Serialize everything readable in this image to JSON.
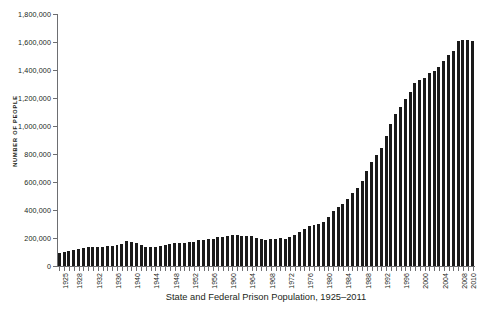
{
  "chart_data": {
    "type": "bar",
    "title": "State and Federal Prison Population, 1925–2011",
    "xlabel": "",
    "ylabel": "NUMBER OF PEOPLE",
    "ylim": [
      0,
      1800000
    ],
    "ytick_labels": [
      "0",
      "200,000",
      "400,000",
      "600,000",
      "800,000",
      "1,000,000",
      "1,200,000",
      "1,400,000",
      "1,600,000",
      "1,800,000"
    ],
    "ytick_values": [
      0,
      200000,
      400000,
      600000,
      800000,
      1000000,
      1200000,
      1400000,
      1600000,
      1800000
    ],
    "grid": false,
    "legend": null,
    "bar_color": "#1a1a1a",
    "axis_color": "#6d6e71",
    "xtick_labels": [
      "1925",
      "1928",
      "1932",
      "1936",
      "1940",
      "1944",
      "1948",
      "1952",
      "1956",
      "1960",
      "1964",
      "1968",
      "1972",
      "1976",
      "1980",
      "1984",
      "1988",
      "1992",
      "1996",
      "2000",
      "2004",
      "2008",
      "2010"
    ],
    "xtick_years": [
      1925,
      1928,
      1932,
      1936,
      1940,
      1944,
      1948,
      1952,
      1956,
      1960,
      1964,
      1968,
      1972,
      1976,
      1980,
      1984,
      1988,
      1992,
      1996,
      2000,
      2004,
      2008,
      2010
    ],
    "categories": [
      1925,
      1926,
      1927,
      1928,
      1929,
      1930,
      1931,
      1932,
      1933,
      1934,
      1935,
      1936,
      1937,
      1938,
      1939,
      1940,
      1941,
      1942,
      1943,
      1944,
      1945,
      1946,
      1947,
      1948,
      1949,
      1950,
      1951,
      1952,
      1953,
      1954,
      1955,
      1956,
      1957,
      1958,
      1959,
      1960,
      1961,
      1962,
      1963,
      1964,
      1965,
      1966,
      1967,
      1968,
      1969,
      1970,
      1971,
      1972,
      1973,
      1974,
      1975,
      1976,
      1977,
      1978,
      1979,
      1980,
      1981,
      1982,
      1983,
      1984,
      1985,
      1986,
      1987,
      1988,
      1989,
      1990,
      1991,
      1992,
      1993,
      1994,
      1995,
      1996,
      1997,
      1998,
      1999,
      2000,
      2001,
      2002,
      2003,
      2004,
      2005,
      2006,
      2007,
      2008,
      2009,
      2010,
      2011
    ],
    "values": [
      91669,
      97991,
      109983,
      116390,
      120496,
      129453,
      137082,
      137997,
      136810,
      138316,
      144180,
      145038,
      152741,
      160285,
      179818,
      173706,
      165439,
      150384,
      137220,
      132456,
      133649,
      140079,
      151304,
      155977,
      163749,
      166123,
      165680,
      168233,
      173579,
      182901,
      185780,
      189565,
      195414,
      205643,
      208105,
      212953,
      220149,
      218830,
      217283,
      214336,
      210895,
      199654,
      194896,
      187914,
      196007,
      196429,
      198061,
      196092,
      204211,
      218466,
      240593,
      262833,
      285456,
      294396,
      301470,
      315974,
      353167,
      394374,
      419820,
      443398,
      480568,
      522084,
      560812,
      603732,
      680907,
      739980,
      789610,
      846277,
      932074,
      1016691,
      1085022,
      1137722,
      1194581,
      1245402,
      1304074,
      1331278,
      1345217,
      1380516,
      1390279,
      1421345,
      1462866,
      1504598,
      1532851,
      1609759,
      1613803,
      1613740,
      1605127
    ],
    "n_bars": 87,
    "x_range": [
      1925,
      2011
    ]
  }
}
